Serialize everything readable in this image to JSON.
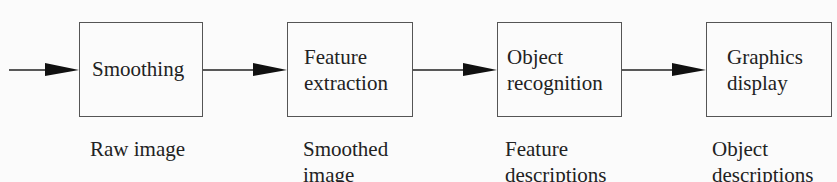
{
  "diagram": {
    "title": "",
    "stages": [
      {
        "id": "smoothing",
        "label_lines": [
          "Smoothing"
        ],
        "input_caption_lines": [
          "Raw image"
        ]
      },
      {
        "id": "feature-extraction",
        "label_lines": [
          "Feature",
          "extraction"
        ],
        "input_caption_lines": [
          "Smoothed",
          "image"
        ]
      },
      {
        "id": "object-recognition",
        "label_lines": [
          "Object",
          "recognition"
        ],
        "input_caption_lines": [
          "Feature",
          "descriptions"
        ]
      },
      {
        "id": "graphics-display",
        "label_lines": [
          "Graphics",
          "display"
        ],
        "input_caption_lines": [
          "Object",
          "descriptions"
        ]
      }
    ],
    "edges": [
      {
        "from": "input",
        "to": "smoothing"
      },
      {
        "from": "smoothing",
        "to": "feature-extraction"
      },
      {
        "from": "feature-extraction",
        "to": "object-recognition"
      },
      {
        "from": "object-recognition",
        "to": "graphics-display"
      }
    ],
    "colors": {
      "stroke": "#555555",
      "text": "#222222",
      "arrow": "#111111",
      "background": "#fbfbfb"
    }
  }
}
